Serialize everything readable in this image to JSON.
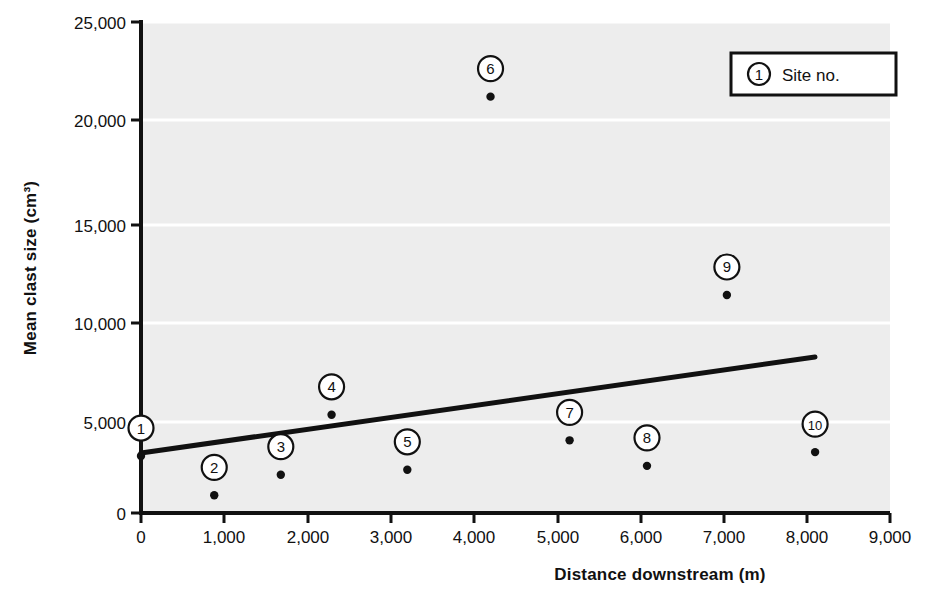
{
  "chart_data": {
    "type": "scatter",
    "title": "",
    "xlabel": "Distance downstream (m)",
    "ylabel": "Mean clast size (cm³)",
    "xlim": [
      0,
      9000
    ],
    "ylim": [
      0,
      25000
    ],
    "xticks": [
      0,
      1000,
      2000,
      3000,
      4000,
      5000,
      6000,
      7000,
      8000,
      9000
    ],
    "xtick_labels": [
      "0",
      "1,000",
      "2,000",
      "3,000",
      "4,000",
      "5,000",
      "6,000",
      "7,000",
      "8,000",
      "9,000"
    ],
    "yticks": [
      0,
      5000,
      10000,
      15000,
      20000,
      25000
    ],
    "ytick_labels": [
      "0",
      "5,000",
      "10,000",
      "15,000",
      "20,000",
      "25,000"
    ],
    "grid": "horizontal-white-major",
    "plot_background": "#ededed",
    "marker_color": "#111111",
    "legend": {
      "position": "top-right",
      "symbol": "1",
      "label": "Site no."
    },
    "point_label_field": "site",
    "points": [
      {
        "site": "1",
        "x": 0,
        "y": 2900
      },
      {
        "site": "2",
        "x": 880,
        "y": 900
      },
      {
        "site": "3",
        "x": 1680,
        "y": 1950
      },
      {
        "site": "4",
        "x": 2290,
        "y": 5000
      },
      {
        "site": "5",
        "x": 3200,
        "y": 2200
      },
      {
        "site": "6",
        "x": 4200,
        "y": 21200
      },
      {
        "site": "7",
        "x": 5150,
        "y": 3700
      },
      {
        "site": "8",
        "x": 6080,
        "y": 2400
      },
      {
        "site": "9",
        "x": 7040,
        "y": 11100
      },
      {
        "site": "10",
        "x": 8100,
        "y": 3100
      }
    ],
    "trendline": {
      "type": "linear-best-fit",
      "x_start": 0,
      "y_start": 3050,
      "x_end": 8100,
      "y_end": 7950,
      "color": "#111111"
    }
  }
}
